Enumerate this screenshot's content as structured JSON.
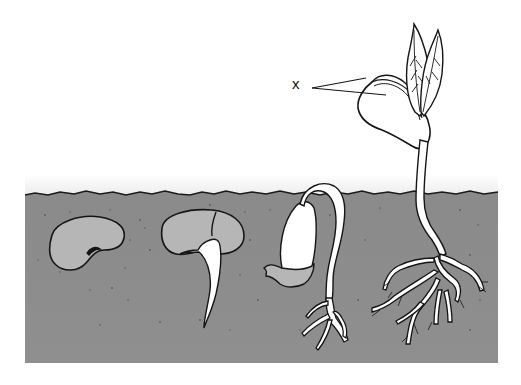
{
  "diagram": {
    "labels": [
      {
        "id": "x",
        "text": "x",
        "points_to": "cotyledons"
      }
    ],
    "stages": [
      {
        "index": 1,
        "name": "dry-seed"
      },
      {
        "index": 2,
        "name": "radicle-emerging"
      },
      {
        "index": 3,
        "name": "hypocotyl-hook"
      },
      {
        "index": 4,
        "name": "seedling-with-leaves"
      }
    ],
    "colors": {
      "soil": "#8e8e8e",
      "soil_dark": "#838383",
      "seed": "#b4b4b4",
      "outline": "#151515",
      "sky": "#ffffff",
      "plant": "#ffffff"
    }
  }
}
